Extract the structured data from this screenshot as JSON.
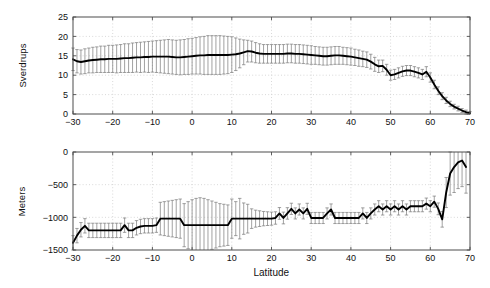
{
  "figure": {
    "background": "#ffffff",
    "line_color": "#000000",
    "errorbar_color": "#7a7a7a",
    "grid_color": "#c8c8c8",
    "axis_color": "#4d4d4d"
  },
  "chart_data": [
    {
      "type": "line",
      "title": "",
      "xlabel": "",
      "ylabel": "Sverdrups",
      "xlim": [
        -30,
        70
      ],
      "ylim": [
        0,
        25
      ],
      "xticks": [
        -30,
        -20,
        -10,
        0,
        10,
        20,
        30,
        40,
        50,
        60,
        70
      ],
      "xticklabels": [
        "-30",
        "-20",
        "-10",
        "0",
        "10",
        "20",
        "30",
        "40",
        "50",
        "60",
        "70"
      ],
      "yticks": [
        0,
        5,
        10,
        15,
        20,
        25
      ],
      "yticklabels": [
        "0",
        "5",
        "10",
        "15",
        "20",
        "25"
      ],
      "grid": true,
      "errorbars": true,
      "series": [
        {
          "name": "Meridional overturning transport",
          "x": [
            -30,
            -29,
            -28,
            -27,
            -26,
            -25,
            -24,
            -23,
            -22,
            -21,
            -20,
            -19,
            -18,
            -17,
            -16,
            -15,
            -14,
            -13,
            -12,
            -11,
            -10,
            -9,
            -8,
            -7,
            -6,
            -5,
            -4,
            -3,
            -2,
            -1,
            0,
            1,
            2,
            3,
            4,
            5,
            6,
            7,
            8,
            9,
            10,
            11,
            12,
            13,
            14,
            15,
            16,
            17,
            18,
            19,
            20,
            21,
            22,
            23,
            24,
            25,
            26,
            27,
            28,
            29,
            30,
            31,
            32,
            33,
            34,
            35,
            36,
            37,
            38,
            39,
            40,
            41,
            42,
            43,
            44,
            45,
            46,
            47,
            48,
            49,
            50,
            51,
            52,
            53,
            54,
            55,
            56,
            57,
            58,
            59,
            60,
            61,
            62,
            63,
            64,
            65,
            66,
            67,
            68,
            69,
            70
          ],
          "y": [
            14.1,
            13.6,
            13.4,
            13.6,
            13.8,
            13.9,
            14.0,
            14.1,
            14.1,
            14.2,
            14.2,
            14.2,
            14.3,
            14.4,
            14.4,
            14.5,
            14.6,
            14.6,
            14.7,
            14.7,
            14.8,
            14.8,
            14.8,
            14.8,
            14.8,
            14.7,
            14.6,
            14.6,
            14.7,
            14.8,
            14.9,
            15.0,
            15.1,
            15.1,
            15.2,
            15.2,
            15.2,
            15.2,
            15.2,
            15.2,
            15.3,
            15.4,
            15.6,
            15.9,
            16.2,
            16.1,
            15.8,
            15.6,
            15.5,
            15.5,
            15.5,
            15.5,
            15.5,
            15.5,
            15.6,
            15.6,
            15.5,
            15.5,
            15.4,
            15.3,
            15.2,
            15.1,
            15.0,
            14.9,
            14.9,
            15.0,
            15.1,
            15.1,
            15.0,
            14.9,
            14.8,
            14.6,
            14.4,
            14.2,
            14.0,
            13.5,
            12.8,
            12.3,
            12.4,
            11.4,
            10.0,
            10.2,
            10.6,
            11.0,
            11.2,
            11.2,
            10.9,
            10.6,
            10.2,
            10.9,
            9.4,
            7.6,
            6.0,
            4.6,
            3.5,
            2.6,
            1.9,
            1.4,
            0.9,
            0.5,
            0.2
          ],
          "yerr": [
            2.9,
            3.0,
            3.1,
            3.2,
            3.2,
            3.3,
            3.3,
            3.4,
            3.4,
            3.5,
            3.5,
            3.6,
            3.6,
            3.7,
            3.7,
            3.8,
            3.8,
            3.9,
            3.9,
            4.0,
            4.0,
            4.1,
            4.2,
            4.3,
            4.4,
            4.4,
            4.4,
            4.5,
            4.5,
            4.6,
            4.6,
            4.7,
            4.8,
            4.9,
            5.0,
            5.0,
            5.0,
            5.0,
            4.9,
            4.8,
            4.6,
            4.2,
            3.7,
            3.2,
            2.8,
            2.7,
            2.6,
            2.5,
            2.4,
            2.4,
            2.4,
            2.4,
            2.4,
            2.4,
            2.4,
            2.4,
            2.4,
            2.4,
            2.4,
            2.4,
            2.4,
            2.3,
            2.3,
            2.3,
            2.3,
            2.3,
            2.3,
            2.3,
            2.2,
            2.2,
            2.2,
            2.1,
            2.1,
            2.0,
            2.0,
            1.9,
            1.8,
            1.6,
            1.5,
            1.4,
            1.3,
            1.3,
            1.3,
            1.3,
            1.3,
            1.3,
            1.3,
            1.3,
            1.3,
            1.3,
            1.2,
            1.1,
            1.0,
            0.9,
            0.8,
            0.7,
            0.6,
            0.6,
            0.5,
            0.5,
            0.4
          ]
        }
      ]
    },
    {
      "type": "line",
      "title": "",
      "xlabel": "Latitude",
      "ylabel": "Meters",
      "xlim": [
        -30,
        70
      ],
      "ylim": [
        -1500,
        0
      ],
      "xticks": [
        -30,
        -20,
        -10,
        0,
        10,
        20,
        30,
        40,
        50,
        60,
        70
      ],
      "xticklabels": [
        "-30",
        "-20",
        "-10",
        "0",
        "10",
        "20",
        "30",
        "40",
        "50",
        "60",
        "70"
      ],
      "yticks": [
        -1500,
        -1000,
        -500,
        0
      ],
      "yticklabels": [
        "-1500",
        "-1000",
        "-500",
        "0"
      ],
      "grid": true,
      "errorbars": true,
      "series": [
        {
          "name": "Depth of overturning maximum",
          "x": [
            -30,
            -29,
            -28,
            -27,
            -26,
            -25,
            -24,
            -23,
            -22,
            -21,
            -20,
            -19,
            -18,
            -17,
            -16,
            -15,
            -14,
            -13,
            -12,
            -11,
            -10,
            -9,
            -8,
            -7,
            -6,
            -5,
            -4,
            -3,
            -2,
            -1,
            0,
            1,
            2,
            3,
            4,
            5,
            6,
            7,
            8,
            9,
            10,
            11,
            12,
            13,
            14,
            15,
            16,
            17,
            18,
            19,
            20,
            21,
            22,
            23,
            24,
            25,
            26,
            27,
            28,
            29,
            30,
            31,
            32,
            33,
            34,
            35,
            36,
            37,
            38,
            39,
            40,
            41,
            42,
            43,
            44,
            45,
            46,
            47,
            48,
            49,
            50,
            51,
            52,
            53,
            54,
            55,
            56,
            57,
            58,
            59,
            60,
            61,
            62,
            63,
            64,
            65,
            66,
            67,
            68,
            69,
            70
          ],
          "y": [
            -1390,
            -1280,
            -1190,
            -1130,
            -1200,
            -1200,
            -1200,
            -1200,
            -1200,
            -1200,
            -1200,
            -1200,
            -1200,
            -1120,
            -1200,
            -1200,
            -1160,
            -1140,
            -1130,
            -1130,
            -1130,
            -1120,
            -1020,
            -1020,
            -1020,
            -1020,
            -1020,
            -1020,
            -1120,
            -1120,
            -1120,
            -1120,
            -1120,
            -1120,
            -1120,
            -1120,
            -1120,
            -1120,
            -1120,
            -1120,
            -1020,
            -1020,
            -1020,
            -1020,
            -1020,
            -1020,
            -1020,
            -1020,
            -1020,
            -1020,
            -1020,
            -1010,
            -940,
            -1010,
            -940,
            -870,
            -940,
            -880,
            -940,
            -870,
            -1010,
            -1010,
            -1010,
            -1010,
            -940,
            -880,
            -1010,
            -1010,
            -1010,
            -1010,
            -1010,
            -1010,
            -1010,
            -940,
            -1010,
            -940,
            -880,
            -830,
            -880,
            -830,
            -880,
            -830,
            -880,
            -830,
            -880,
            -830,
            -830,
            -830,
            -830,
            -790,
            -830,
            -760,
            -870,
            -1030,
            -620,
            -330,
            -230,
            -160,
            -130,
            -230
          ],
          "yerr": [
            110,
            110,
            110,
            110,
            110,
            110,
            110,
            110,
            110,
            110,
            110,
            110,
            110,
            110,
            110,
            110,
            110,
            110,
            110,
            110,
            110,
            110,
            250,
            260,
            270,
            280,
            290,
            300,
            330,
            360,
            390,
            410,
            420,
            410,
            390,
            370,
            350,
            330,
            320,
            310,
            300,
            260,
            310,
            240,
            220,
            150,
            130,
            120,
            110,
            105,
            100,
            95,
            90,
            90,
            88,
            86,
            85,
            85,
            85,
            85,
            85,
            85,
            85,
            85,
            85,
            85,
            85,
            85,
            85,
            85,
            85,
            85,
            85,
            85,
            85,
            85,
            85,
            85,
            85,
            85,
            85,
            85,
            85,
            85,
            85,
            85,
            85,
            85,
            85,
            85,
            85,
            85,
            90,
            120,
            230,
            330,
            390,
            400,
            400,
            400,
            400
          ]
        }
      ]
    }
  ]
}
